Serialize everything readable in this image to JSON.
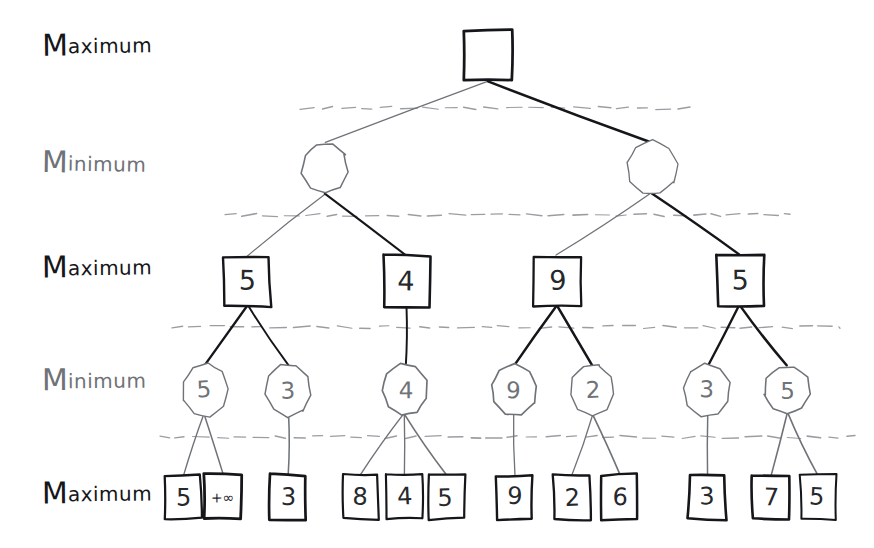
{
  "diagram": {
    "background_color": "#ffffff",
    "ink_dark": "#15161a",
    "ink_gray": "#6f7378",
    "dashed_color": "#9a9da2"
  },
  "row_labels": [
    {
      "id": "row-label-1",
      "cap": "M",
      "rest": "aximum",
      "full": "Maximum",
      "tone": "dark",
      "x": 42,
      "y": 30
    },
    {
      "id": "row-label-2",
      "cap": "M",
      "rest": "inimum",
      "full": "Minimum",
      "tone": "gray",
      "x": 42,
      "y": 148
    },
    {
      "id": "row-label-3",
      "cap": "M",
      "rest": "aximum",
      "full": "Maximum",
      "tone": "dark",
      "x": 42,
      "y": 252
    },
    {
      "id": "row-label-4",
      "cap": "M",
      "rest": "inimum",
      "full": "Minimum",
      "tone": "gray",
      "x": 42,
      "y": 365
    },
    {
      "id": "row-label-5",
      "cap": "M",
      "rest": "aximum",
      "full": "Maximum",
      "tone": "dark",
      "x": 42,
      "y": 478
    }
  ],
  "separators": [
    {
      "id": "separator-1",
      "y": 108,
      "x1": 300,
      "x2": 690
    },
    {
      "id": "separator-2",
      "y": 215,
      "x1": 225,
      "x2": 790
    },
    {
      "id": "separator-3",
      "y": 327,
      "x1": 172,
      "x2": 840
    },
    {
      "id": "separator-4",
      "y": 437,
      "x1": 160,
      "x2": 855
    }
  ],
  "levels": [
    {
      "index": 0,
      "player": "Maximum",
      "shape": "square",
      "label_ref": "row-label-1"
    },
    {
      "index": 1,
      "player": "Minimum",
      "shape": "circle",
      "label_ref": "row-label-2"
    },
    {
      "index": 2,
      "player": "Maximum",
      "shape": "square",
      "label_ref": "row-label-3"
    },
    {
      "index": 3,
      "player": "Minimum",
      "shape": "circle",
      "label_ref": "row-label-4"
    },
    {
      "index": 4,
      "player": "Maximum",
      "shape": "square",
      "label_ref": "row-label-5"
    }
  ],
  "nodes": {
    "root": [
      {
        "id": "n0-0",
        "value": "",
        "shape": "square",
        "cx": 489,
        "cy": 55,
        "w": 48,
        "h": 50,
        "tone": "dark"
      }
    ],
    "level1": [
      {
        "id": "n1-0",
        "value": "",
        "shape": "circle",
        "cx": 325,
        "cy": 168,
        "r": 25,
        "tone": "gray"
      },
      {
        "id": "n1-1",
        "value": "",
        "shape": "circle",
        "cx": 652,
        "cy": 168,
        "r": 25,
        "tone": "gray"
      }
    ],
    "level2": [
      {
        "id": "n2-0",
        "value": "5",
        "shape": "square",
        "cx": 247,
        "cy": 281,
        "w": 46,
        "h": 50,
        "tone": "dark"
      },
      {
        "id": "n2-1",
        "value": "4",
        "shape": "square",
        "cx": 407,
        "cy": 281,
        "w": 46,
        "h": 50,
        "tone": "dark"
      },
      {
        "id": "n2-2",
        "value": "9",
        "shape": "square",
        "cx": 557,
        "cy": 281,
        "w": 46,
        "h": 50,
        "tone": "dark"
      },
      {
        "id": "n2-3",
        "value": "5",
        "shape": "square",
        "cx": 740,
        "cy": 281,
        "w": 46,
        "h": 50,
        "tone": "dark"
      }
    ],
    "level3": [
      {
        "id": "n3-0",
        "value": "5",
        "shape": "circle",
        "cx": 205,
        "cy": 390,
        "r": 24,
        "tone": "gray"
      },
      {
        "id": "n3-1",
        "value": "3",
        "shape": "circle",
        "cx": 288,
        "cy": 390,
        "r": 24,
        "tone": "gray"
      },
      {
        "id": "n3-2",
        "value": "4",
        "shape": "circle",
        "cx": 405,
        "cy": 390,
        "r": 24,
        "tone": "gray"
      },
      {
        "id": "n3-3",
        "value": "9",
        "shape": "circle",
        "cx": 514,
        "cy": 390,
        "r": 24,
        "tone": "gray"
      },
      {
        "id": "n3-4",
        "value": "2",
        "shape": "circle",
        "cx": 592,
        "cy": 390,
        "r": 24,
        "tone": "gray"
      },
      {
        "id": "n3-5",
        "value": "3",
        "shape": "circle",
        "cx": 707,
        "cy": 390,
        "r": 24,
        "tone": "gray"
      },
      {
        "id": "n3-6",
        "value": "5",
        "shape": "circle",
        "cx": 787,
        "cy": 390,
        "r": 24,
        "tone": "gray"
      }
    ],
    "level4": [
      {
        "id": "n4-0",
        "value": "5",
        "shape": "square",
        "cx": 183,
        "cy": 497,
        "w": 36,
        "h": 44,
        "tone": "dark"
      },
      {
        "id": "n4-1",
        "value": "+∞",
        "shape": "square",
        "cx": 223,
        "cy": 497,
        "w": 36,
        "h": 44,
        "tone": "dark"
      },
      {
        "id": "n4-2",
        "value": "3",
        "shape": "square",
        "cx": 288,
        "cy": 497,
        "w": 36,
        "h": 44,
        "tone": "dark"
      },
      {
        "id": "n4-3",
        "value": "8",
        "shape": "square",
        "cx": 360,
        "cy": 497,
        "w": 36,
        "h": 44,
        "tone": "dark"
      },
      {
        "id": "n4-4",
        "value": "4",
        "shape": "square",
        "cx": 405,
        "cy": 497,
        "w": 36,
        "h": 44,
        "tone": "dark"
      },
      {
        "id": "n4-5",
        "value": "5",
        "shape": "square",
        "cx": 446,
        "cy": 497,
        "w": 36,
        "h": 44,
        "tone": "dark"
      },
      {
        "id": "n4-6",
        "value": "9",
        "shape": "square",
        "cx": 514,
        "cy": 497,
        "w": 36,
        "h": 44,
        "tone": "dark"
      },
      {
        "id": "n4-7",
        "value": "2",
        "shape": "square",
        "cx": 572,
        "cy": 497,
        "w": 36,
        "h": 44,
        "tone": "dark"
      },
      {
        "id": "n4-8",
        "value": "6",
        "shape": "square",
        "cx": 620,
        "cy": 497,
        "w": 36,
        "h": 44,
        "tone": "dark"
      },
      {
        "id": "n4-9",
        "value": "3",
        "shape": "square",
        "cx": 707,
        "cy": 497,
        "w": 36,
        "h": 44,
        "tone": "dark"
      },
      {
        "id": "n4-10",
        "value": "7",
        "shape": "square",
        "cx": 771,
        "cy": 497,
        "w": 36,
        "h": 44,
        "tone": "dark"
      },
      {
        "id": "n4-11",
        "value": "5",
        "shape": "square",
        "cx": 818,
        "cy": 497,
        "w": 36,
        "h": 44,
        "tone": "dark"
      }
    ]
  },
  "edges": [
    {
      "id": "e-root-l",
      "from": "n0-0",
      "to": "n1-0",
      "x1": 489,
      "y1": 81,
      "x2": 325,
      "y2": 143,
      "tone": "gray"
    },
    {
      "id": "e-root-r",
      "from": "n0-0",
      "to": "n1-1",
      "x1": 489,
      "y1": 81,
      "x2": 652,
      "y2": 143,
      "tone": "dark"
    },
    {
      "id": "e-1-0-a",
      "from": "n1-0",
      "to": "n2-0",
      "x1": 325,
      "y1": 193,
      "x2": 247,
      "y2": 256,
      "tone": "gray"
    },
    {
      "id": "e-1-0-b",
      "from": "n1-0",
      "to": "n2-1",
      "x1": 325,
      "y1": 193,
      "x2": 407,
      "y2": 256,
      "tone": "dark"
    },
    {
      "id": "e-1-1-a",
      "from": "n1-1",
      "to": "n2-2",
      "x1": 652,
      "y1": 193,
      "x2": 557,
      "y2": 256,
      "tone": "gray"
    },
    {
      "id": "e-1-1-b",
      "from": "n1-1",
      "to": "n2-3",
      "x1": 652,
      "y1": 193,
      "x2": 740,
      "y2": 256,
      "tone": "dark"
    },
    {
      "id": "e-2-0-a",
      "from": "n2-0",
      "to": "n3-0",
      "x1": 247,
      "y1": 306,
      "x2": 205,
      "y2": 366,
      "tone": "dark"
    },
    {
      "id": "e-2-0-b",
      "from": "n2-0",
      "to": "n3-1",
      "x1": 247,
      "y1": 306,
      "x2": 288,
      "y2": 366,
      "tone": "dark"
    },
    {
      "id": "e-2-1-a",
      "from": "n2-1",
      "to": "n3-2",
      "x1": 407,
      "y1": 306,
      "x2": 405,
      "y2": 366,
      "tone": "dark"
    },
    {
      "id": "e-2-2-a",
      "from": "n2-2",
      "to": "n3-3",
      "x1": 557,
      "y1": 306,
      "x2": 514,
      "y2": 366,
      "tone": "dark"
    },
    {
      "id": "e-2-2-b",
      "from": "n2-2",
      "to": "n3-4",
      "x1": 557,
      "y1": 306,
      "x2": 592,
      "y2": 366,
      "tone": "dark"
    },
    {
      "id": "e-2-3-a",
      "from": "n2-3",
      "to": "n3-5",
      "x1": 740,
      "y1": 306,
      "x2": 707,
      "y2": 366,
      "tone": "dark"
    },
    {
      "id": "e-2-3-b",
      "from": "n2-3",
      "to": "n3-6",
      "x1": 740,
      "y1": 306,
      "x2": 787,
      "y2": 366,
      "tone": "dark"
    },
    {
      "id": "e-3-0-a",
      "from": "n3-0",
      "to": "n4-0",
      "x1": 205,
      "y1": 414,
      "x2": 183,
      "y2": 475,
      "tone": "gray"
    },
    {
      "id": "e-3-0-b",
      "from": "n3-0",
      "to": "n4-1",
      "x1": 205,
      "y1": 414,
      "x2": 223,
      "y2": 475,
      "tone": "gray"
    },
    {
      "id": "e-3-1-a",
      "from": "n3-1",
      "to": "n4-2",
      "x1": 288,
      "y1": 414,
      "x2": 288,
      "y2": 475,
      "tone": "gray"
    },
    {
      "id": "e-3-2-a",
      "from": "n3-2",
      "to": "n4-3",
      "x1": 405,
      "y1": 414,
      "x2": 360,
      "y2": 475,
      "tone": "gray"
    },
    {
      "id": "e-3-2-b",
      "from": "n3-2",
      "to": "n4-4",
      "x1": 405,
      "y1": 414,
      "x2": 405,
      "y2": 475,
      "tone": "gray"
    },
    {
      "id": "e-3-2-c",
      "from": "n3-2",
      "to": "n4-5",
      "x1": 405,
      "y1": 414,
      "x2": 446,
      "y2": 475,
      "tone": "gray"
    },
    {
      "id": "e-3-3-a",
      "from": "n3-3",
      "to": "n4-6",
      "x1": 514,
      "y1": 414,
      "x2": 514,
      "y2": 475,
      "tone": "gray"
    },
    {
      "id": "e-3-4-a",
      "from": "n3-4",
      "to": "n4-7",
      "x1": 592,
      "y1": 414,
      "x2": 572,
      "y2": 475,
      "tone": "gray"
    },
    {
      "id": "e-3-4-b",
      "from": "n3-4",
      "to": "n4-8",
      "x1": 592,
      "y1": 414,
      "x2": 620,
      "y2": 475,
      "tone": "gray"
    },
    {
      "id": "e-3-5-a",
      "from": "n3-5",
      "to": "n4-9",
      "x1": 707,
      "y1": 414,
      "x2": 707,
      "y2": 475,
      "tone": "gray"
    },
    {
      "id": "e-3-6-a",
      "from": "n3-6",
      "to": "n4-10",
      "x1": 787,
      "y1": 414,
      "x2": 771,
      "y2": 475,
      "tone": "gray"
    },
    {
      "id": "e-3-6-b",
      "from": "n3-6",
      "to": "n4-11",
      "x1": 787,
      "y1": 414,
      "x2": 818,
      "y2": 475,
      "tone": "gray"
    }
  ]
}
